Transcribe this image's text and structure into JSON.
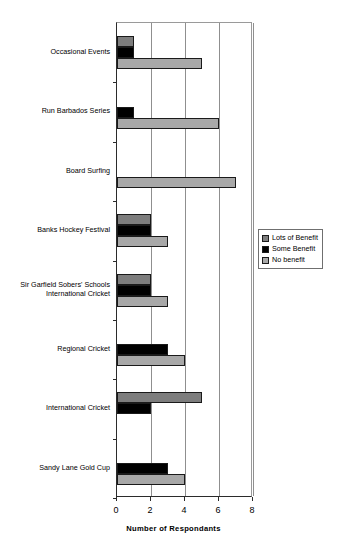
{
  "chart_data": {
    "type": "bar",
    "orientation": "horizontal",
    "title": "",
    "xlabel": "Number of Respondants",
    "ylabel": "",
    "xlim": [
      0,
      8
    ],
    "xticks": [
      0,
      2,
      4,
      6,
      8
    ],
    "grid": "vertical",
    "legend_position": "right-middle",
    "categories": [
      "Occasional Events",
      "Run Barbados Series",
      "Board Surfing",
      "Banks Hockey Festival",
      "Sir Garfield Sobers' Schools\nInternational Cricket",
      "Regional Cricket",
      "International Cricket",
      "Sandy Lane Gold Cup"
    ],
    "category_lines": [
      [
        "Occasional Events"
      ],
      [
        "Run Barbados Series"
      ],
      [
        "Board Surfing"
      ],
      [
        "Banks Hockey Festival"
      ],
      [
        "Sir Garfield Sobers' Schools",
        "International Cricket"
      ],
      [
        "Regional Cricket"
      ],
      [
        "International Cricket"
      ],
      [
        "Sandy Lane Gold Cup"
      ]
    ],
    "series": [
      {
        "name": "Lots of Benefit",
        "color": "#7d7d7d",
        "values": [
          1,
          0,
          0,
          2,
          2,
          0,
          5,
          0
        ]
      },
      {
        "name": "Some Benefit",
        "color": "#000000",
        "values": [
          1,
          1,
          0,
          2,
          2,
          3,
          2,
          3
        ]
      },
      {
        "name": "No benefit",
        "color": "#a8a8a8",
        "values": [
          5,
          6,
          7,
          3,
          3,
          4,
          0,
          4
        ]
      }
    ]
  },
  "axis": {
    "tick_labels": [
      "0",
      "2",
      "4",
      "6",
      "8"
    ],
    "x_axis_title": "Number of Respondants"
  },
  "legend": {
    "items": [
      {
        "label": "Lots of Benefit"
      },
      {
        "label": "Some Benefit"
      },
      {
        "label": "No benefit"
      }
    ]
  }
}
